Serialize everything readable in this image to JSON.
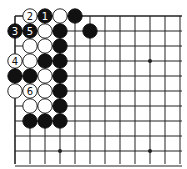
{
  "board": {
    "title": "Go board corner diagram",
    "grid": {
      "origin_x": 15,
      "origin_y": 16,
      "spacing": 15,
      "cols": 12,
      "rows": 11,
      "end_x": 182,
      "end_y": 164
    },
    "edges": {
      "top": true,
      "left": true
    },
    "colors": {
      "line": "#222222",
      "black": "#111111",
      "white": "#ffffff",
      "stone_outline": "#111111"
    },
    "stones": [
      {
        "col": 1,
        "row": 0,
        "color": "white",
        "label": "2"
      },
      {
        "col": 2,
        "row": 0,
        "color": "black",
        "label": "1"
      },
      {
        "col": 3,
        "row": 0,
        "color": "white",
        "label": ""
      },
      {
        "col": 4,
        "row": 0,
        "color": "black",
        "label": ""
      },
      {
        "col": 0,
        "row": 1,
        "color": "black",
        "label": "3"
      },
      {
        "col": 1,
        "row": 1,
        "color": "black",
        "label": "5"
      },
      {
        "col": 2,
        "row": 1,
        "color": "white",
        "label": ""
      },
      {
        "col": 3,
        "row": 1,
        "color": "black",
        "label": ""
      },
      {
        "col": 5,
        "row": 1,
        "color": "black",
        "label": ""
      },
      {
        "col": 1,
        "row": 2,
        "color": "white",
        "label": ""
      },
      {
        "col": 2,
        "row": 2,
        "color": "white",
        "label": ""
      },
      {
        "col": 3,
        "row": 2,
        "color": "black",
        "label": ""
      },
      {
        "col": 0,
        "row": 3,
        "color": "white",
        "label": "4"
      },
      {
        "col": 1,
        "row": 3,
        "color": "white",
        "label": ""
      },
      {
        "col": 2,
        "row": 3,
        "color": "black",
        "label": ""
      },
      {
        "col": 3,
        "row": 3,
        "color": "black",
        "label": ""
      },
      {
        "col": 0,
        "row": 4,
        "color": "black",
        "label": ""
      },
      {
        "col": 1,
        "row": 4,
        "color": "black",
        "label": ""
      },
      {
        "col": 2,
        "row": 4,
        "color": "white",
        "label": ""
      },
      {
        "col": 3,
        "row": 4,
        "color": "black",
        "label": ""
      },
      {
        "col": 0,
        "row": 5,
        "color": "white",
        "label": ""
      },
      {
        "col": 1,
        "row": 5,
        "color": "white",
        "label": "6"
      },
      {
        "col": 2,
        "row": 5,
        "color": "white",
        "label": ""
      },
      {
        "col": 3,
        "row": 5,
        "color": "black",
        "label": ""
      },
      {
        "col": 1,
        "row": 6,
        "color": "white",
        "label": ""
      },
      {
        "col": 2,
        "row": 6,
        "color": "white",
        "label": ""
      },
      {
        "col": 3,
        "row": 6,
        "color": "black",
        "label": ""
      },
      {
        "col": 1,
        "row": 7,
        "color": "black",
        "label": ""
      },
      {
        "col": 2,
        "row": 7,
        "color": "black",
        "label": ""
      },
      {
        "col": 3,
        "row": 7,
        "color": "black",
        "label": ""
      }
    ],
    "star_points": [
      {
        "col": 9,
        "row": 3
      },
      {
        "col": 3,
        "row": 9
      },
      {
        "col": 9,
        "row": 9
      }
    ]
  }
}
